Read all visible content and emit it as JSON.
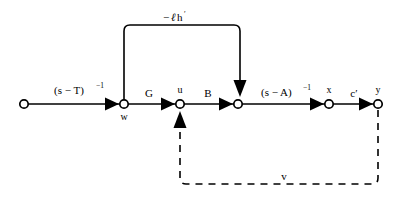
{
  "figure": {
    "type": "signal-flow-graph",
    "title": "",
    "background_color": "#ffffff",
    "stroke_color": "#000000",
    "width": 412,
    "height": 203
  },
  "nodes": [
    {
      "id": "source",
      "label": "",
      "x": 24,
      "y": 104,
      "label_pos": "none"
    },
    {
      "id": "w",
      "label": "w",
      "x": 124,
      "y": 104,
      "label_pos": "below"
    },
    {
      "id": "u",
      "label": "u",
      "x": 180,
      "y": 104,
      "label_pos": "above"
    },
    {
      "id": "mid",
      "label": "",
      "x": 238,
      "y": 104,
      "label_pos": "none"
    },
    {
      "id": "x",
      "label": "x",
      "x": 329,
      "y": 104,
      "label_pos": "above"
    },
    {
      "id": "y",
      "label": "y",
      "x": 378,
      "y": 104,
      "label_pos": "above"
    }
  ],
  "edges": [
    {
      "id": "source-to-w",
      "from": "source",
      "to": "w",
      "style": "solid",
      "label_base": "(s − T)",
      "label_sup": "−1",
      "label_x": 74,
      "label_y": 90
    },
    {
      "id": "w-to-u",
      "from": "w",
      "to": "u",
      "style": "solid",
      "label_base": "G",
      "label_sup": "",
      "label_x": 152,
      "label_y": 97
    },
    {
      "id": "u-to-mid",
      "from": "u",
      "to": "mid",
      "style": "solid",
      "label_base": "B",
      "label_sup": "",
      "label_x": 209,
      "label_y": 97
    },
    {
      "id": "mid-to-x",
      "from": "mid",
      "to": "x",
      "style": "solid",
      "label_base": "(s − A)",
      "label_sup": "−1",
      "label_x": 284,
      "label_y": 92
    },
    {
      "id": "x-to-y",
      "from": "x",
      "to": "y",
      "style": "solid",
      "label_base": "c′",
      "label_sup": "",
      "label_x": 355,
      "label_y": 96
    },
    {
      "id": "feedback-top",
      "from": "w",
      "to": "mid",
      "style": "solid",
      "label_base": "−ℓh′",
      "label_sup": "",
      "label_x": 180,
      "label_y": 21
    },
    {
      "id": "feedback-bottom",
      "from": "y",
      "to": "u",
      "style": "dashed",
      "label_base": "v",
      "label_sup": "",
      "label_x": 284,
      "label_y": 180
    }
  ],
  "labels": {
    "top_feedback_minus": "−",
    "top_feedback_ell": "ℓ",
    "top_feedback_h": "h",
    "top_feedback_prime": "′",
    "bottom_feedback": "v",
    "gain_G": "G",
    "gain_B": "B",
    "gain_cprime": "c′",
    "resolvent_T_base": "(s − T)",
    "resolvent_T_exp": "−1",
    "resolvent_A_base": "(s − A)",
    "resolvent_A_exp": "−1",
    "node_w": "w",
    "node_u": "u",
    "node_x": "x",
    "node_y": "y"
  }
}
